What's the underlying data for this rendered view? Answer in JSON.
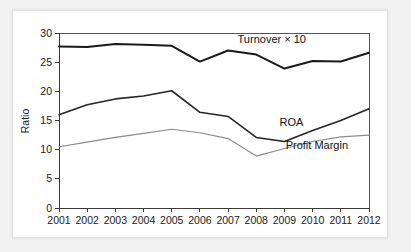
{
  "chart_data": {
    "type": "line",
    "title": "",
    "xlabel": "",
    "ylabel": "Ratio",
    "x": [
      2001,
      2002,
      2003,
      2004,
      2005,
      2006,
      2007,
      2008,
      2009,
      2010,
      2011,
      2012
    ],
    "xtick_labels": [
      "2001",
      "2002",
      "2003",
      "2004",
      "2005",
      "2006",
      "2007",
      "2008",
      "2009",
      "2010",
      "2011",
      "2012"
    ],
    "ytick_labels": [
      "0",
      "5",
      "10",
      "15",
      "20",
      "25",
      "30"
    ],
    "yticks": [
      0,
      5,
      10,
      15,
      20,
      25,
      30
    ],
    "ylim": [
      0,
      30
    ],
    "xlim": [
      2001,
      2012
    ],
    "grid": false,
    "legend": "inline-annotations",
    "series": [
      {
        "name": "Turnover × 10",
        "color": "#1a1a1a",
        "width": 2.0,
        "values": [
          27.7,
          27.6,
          28.1,
          28.0,
          27.8,
          25.1,
          27.0,
          26.3,
          23.9,
          25.2,
          25.1,
          26.6
        ]
      },
      {
        "name": "ROA",
        "color": "#262626",
        "width": 1.6,
        "values": [
          16.0,
          17.7,
          18.7,
          19.2,
          20.1,
          16.4,
          15.7,
          12.1,
          11.4,
          13.3,
          15.0,
          17.0
        ]
      },
      {
        "name": "Profit Margin",
        "color": "#8c8c8c",
        "width": 1.2,
        "values": [
          10.5,
          11.3,
          12.1,
          12.8,
          13.5,
          12.9,
          11.9,
          8.9,
          10.2,
          11.4,
          12.2,
          12.5
        ]
      }
    ],
    "annotations": [
      {
        "text": "Turnover × 10",
        "x": 2008.55,
        "y": 28.25,
        "anchor": "middle"
      },
      {
        "text": "ROA",
        "x": 2009.25,
        "y": 14.1,
        "anchor": "middle"
      },
      {
        "text": "Profit Margin",
        "x": 2010.15,
        "y": 10.15,
        "anchor": "middle"
      }
    ]
  },
  "colors": {
    "page_background": "#f2f2f2",
    "card_background": "#ffffff",
    "card_border": "#e2e2e2",
    "axis": "#3a3a3a",
    "text": "#1a1a1a"
  }
}
